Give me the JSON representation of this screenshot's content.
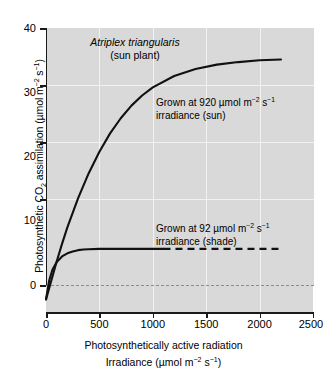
{
  "chart_data": {
    "type": "line",
    "title": "Atriplex triangularis (sun plant)",
    "title_species": "Atriplex triangularis",
    "title_subtitle": "(sun plant)",
    "xlabel_line1": "Photosynthetically active radiation",
    "xlabel_line2": "Irradiance (µmol m⁻² s⁻¹)",
    "ylabel": "Photosynthetic CO₂ assimilation (µmol m⁻² s⁻¹)",
    "xlim": [
      0,
      2500
    ],
    "ylim": [
      -5,
      40
    ],
    "xticks": [
      0,
      500,
      1000,
      1500,
      2000,
      2500
    ],
    "xtick_labels": [
      "0",
      "500",
      "1000",
      "1500",
      "2000",
      "2500"
    ],
    "yticks": [
      0,
      10,
      20,
      30,
      40
    ],
    "ytick_labels": [
      "0",
      "10",
      "20",
      "30",
      "40"
    ],
    "grid": true,
    "grid_color": "#f2f2f2",
    "plot_background": "#d9d9d9",
    "line_color": "#111111",
    "zero_line_style": "dashed",
    "zero_line_color": "#8c8c8c",
    "legend": "none",
    "series": [
      {
        "name": "Grown at 920 µmol m⁻² s⁻¹ irradiance (sun)",
        "short_name": "sun",
        "style": "solid",
        "saturation_value": 35,
        "dark_respiration": -3,
        "light_compensation_point": 50,
        "x": [
          0,
          50,
          100,
          150,
          200,
          300,
          400,
          500,
          600,
          700,
          800,
          900,
          1000,
          1200,
          1400,
          1600,
          1800,
          2000,
          2200
        ],
        "y": [
          -3.0,
          0.0,
          3.0,
          5.8,
          8.4,
          13.0,
          17.0,
          20.4,
          23.3,
          25.7,
          27.7,
          29.3,
          30.6,
          32.4,
          33.5,
          34.2,
          34.6,
          34.9,
          35.0
        ]
      },
      {
        "name": "Grown at 92 µmol m⁻² s⁻¹ irradiance (shade)",
        "short_name": "shade",
        "style": "solid-then-dashed",
        "dash_starts_at_x": 1100,
        "saturation_value": 5,
        "dark_respiration": -3,
        "light_compensation_point": 30,
        "x": [
          0,
          30,
          60,
          100,
          150,
          200,
          250,
          300,
          350,
          400,
          500,
          600,
          700,
          800,
          900,
          1000,
          1100,
          1400,
          1700,
          2000,
          2200
        ],
        "y": [
          -3.0,
          0.0,
          1.7,
          2.9,
          3.8,
          4.3,
          4.6,
          4.8,
          4.9,
          4.95,
          5.0,
          5.0,
          5.0,
          5.0,
          5.0,
          5.0,
          5.0,
          5.0,
          5.0,
          5.0,
          5.0
        ]
      }
    ],
    "annotations": [
      {
        "id": "sun",
        "line1": "Grown at 920 µmol m⁻² s⁻¹",
        "line2": "irradiance (sun)",
        "line1_prefix": "Grown at 920 µmol m",
        "line1_sup1": "−2",
        "line1_mid": " s",
        "line1_sup2": "−1"
      },
      {
        "id": "shade",
        "line1": "Grown at 92 µmol m⁻² s⁻¹",
        "line2": "irradiance (shade)",
        "line1_prefix": "Grown at 92 µmol m",
        "line1_sup1": "−2",
        "line1_mid": " s",
        "line1_sup2": "−1"
      }
    ]
  },
  "axis": {
    "y_title_prefix": "Photosynthetic CO",
    "y_title_sub": "2",
    "y_title_mid": " assimilation (µmol m",
    "y_title_sup1": "−2",
    "y_title_mid2": " s",
    "y_title_sup2": "−1",
    "y_title_suffix": ")",
    "x_title_line1": "Photosynthetically active radiation",
    "x_title_line2_prefix": "Irradiance (µmol m",
    "x_title_line2_sup1": "−2",
    "x_title_line2_mid": " s",
    "x_title_line2_sup2": "−1",
    "x_title_line2_suffix": ")"
  }
}
